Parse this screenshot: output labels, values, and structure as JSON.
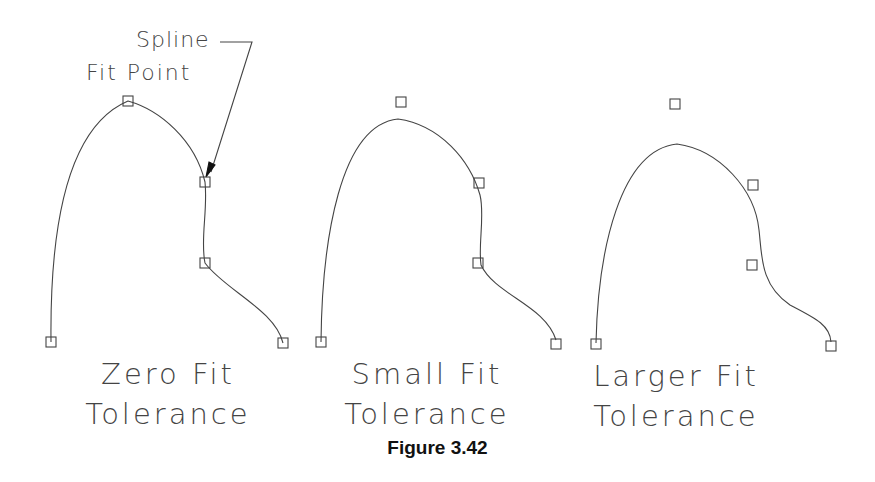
{
  "figure": {
    "caption": "Figure 3.42",
    "callout": {
      "line1": "Spline",
      "line2": "Fit Point"
    },
    "panels": [
      {
        "label_line1": "Zero Fit",
        "label_line2": "Tolerance",
        "fit_points": [
          [
            51,
            342
          ],
          [
            128,
            101
          ],
          [
            205,
            182
          ],
          [
            205,
            263
          ],
          [
            283,
            343
          ]
        ]
      },
      {
        "label_line1": "Small Fit",
        "label_line2": "Tolerance",
        "fit_points": [
          [
            321,
            342
          ],
          [
            401,
            102
          ],
          [
            479,
            183
          ],
          [
            478,
            263
          ],
          [
            556,
            344
          ]
        ]
      },
      {
        "label_line1": "Larger Fit",
        "label_line2": "Tolerance",
        "fit_points": [
          [
            596,
            344
          ],
          [
            675,
            104
          ],
          [
            753,
            185
          ],
          [
            752,
            265
          ],
          [
            831,
            346
          ]
        ]
      }
    ],
    "colors": {
      "line": "#444444",
      "background": "#ffffff"
    }
  }
}
